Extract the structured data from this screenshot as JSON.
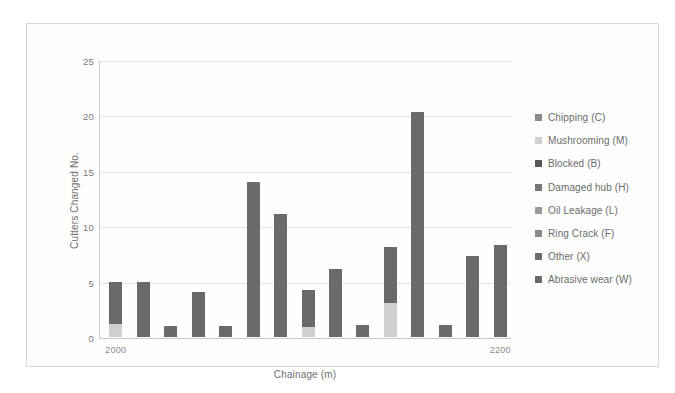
{
  "chart_data": {
    "type": "bar",
    "subtype": "stacked-bar",
    "title": "",
    "xlabel": "Chainage (m)",
    "ylabel": "Cutters Changed No.",
    "ylim": [
      0,
      25
    ],
    "yticks": [
      0,
      5,
      10,
      15,
      20,
      25
    ],
    "ytick_labels": [
      "0",
      "5",
      "10",
      "15",
      "20",
      "25"
    ],
    "grid": "horizontal",
    "xlim": [
      2000,
      2200
    ],
    "xtick_labels": [
      "2000",
      "2200"
    ],
    "legend_position": "right",
    "categories": [
      "2004",
      "2017",
      "2030",
      "2043",
      "2056",
      "2069",
      "2082",
      "2095",
      "2108",
      "2121",
      "2134",
      "2147",
      "2160",
      "2173",
      "2186"
    ],
    "series": [
      {
        "name": "Chipping (C)",
        "color": "#8c8c8c",
        "values": [
          0,
          0,
          0,
          0,
          0,
          0,
          0,
          0,
          0,
          0,
          0,
          0,
          0,
          0,
          0
        ]
      },
      {
        "name": "Mushrooming (M)",
        "color": "#cfcfcf",
        "values": [
          1.2,
          0,
          0,
          0,
          0,
          0,
          0,
          0.9,
          0,
          0,
          3.1,
          0,
          0,
          0,
          0
        ]
      },
      {
        "name": "Blocked (B)",
        "color": "#585858",
        "values": [
          0,
          0,
          0,
          0,
          0,
          0,
          0,
          0,
          0,
          0,
          0,
          0,
          0,
          0,
          0
        ]
      },
      {
        "name": "Damaged hub (H)",
        "color": "#777777",
        "values": [
          0,
          0,
          0,
          0,
          0,
          0,
          0,
          0,
          0,
          0,
          0,
          0,
          0,
          0,
          0
        ]
      },
      {
        "name": "Oil Leakage (L)",
        "color": "#9a9a9a",
        "values": [
          0,
          0,
          0,
          0,
          0,
          0,
          0,
          0,
          0,
          0,
          0,
          0,
          0,
          0,
          0
        ]
      },
      {
        "name": "Ring Crack (F)",
        "color": "#8a8a8a",
        "values": [
          0,
          0,
          0,
          0,
          0,
          0,
          0,
          0,
          0,
          0,
          0,
          0,
          0,
          0,
          0
        ]
      },
      {
        "name": "Other (X)",
        "color": "#6e6e6e",
        "values": [
          0,
          0,
          0,
          0,
          0,
          0,
          0,
          0,
          0,
          0,
          0,
          0,
          0,
          0,
          0
        ]
      },
      {
        "name": "Abrasive wear (W)",
        "color": "#6a6a6a",
        "values": [
          3.8,
          5.0,
          1.0,
          4.1,
          1.0,
          14.0,
          11.1,
          3.3,
          6.1,
          1.1,
          5.0,
          20.3,
          1.1,
          7.3,
          8.3
        ]
      }
    ],
    "bar_totals": [
      5.0,
      5.0,
      1.0,
      4.1,
      1.0,
      14.0,
      11.1,
      4.2,
      6.1,
      1.1,
      8.1,
      20.3,
      1.1,
      7.3,
      8.3
    ]
  },
  "legend": {
    "items": [
      {
        "label": "Chipping (C)",
        "color": "#8c8c8c"
      },
      {
        "label": "Mushrooming (M)",
        "color": "#cfcfcf"
      },
      {
        "label": "Blocked (B)",
        "color": "#585858"
      },
      {
        "label": "Damaged hub (H)",
        "color": "#777777"
      },
      {
        "label": "Oil Leakage (L)",
        "color": "#9a9a9a"
      },
      {
        "label": "Ring Crack (F)",
        "color": "#8a8a8a"
      },
      {
        "label": "Other (X)",
        "color": "#6e6e6e"
      },
      {
        "label": "Abrasive wear (W)",
        "color": "#6a6a6a"
      }
    ]
  },
  "axes": {
    "y_title": "Cutters Changed No.",
    "x_title": "Chainage (m)",
    "y_ticks": [
      "25",
      "20",
      "15",
      "10",
      "5",
      "0"
    ],
    "x_ticks": [
      "2000",
      "2200"
    ]
  }
}
